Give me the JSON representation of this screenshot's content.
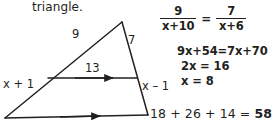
{
  "prompt": {
    "text": "triangle."
  },
  "figure": {
    "name": "triangle-with-parallel-transversal",
    "labels": {
      "upper_left_side": "9",
      "upper_right_side": "7",
      "transversal": "13",
      "lower_left_side": "x + 1",
      "lower_right_side": "x – 1"
    },
    "stroke_color": "#231f20"
  },
  "solution": {
    "proportion": {
      "left": {
        "numerator": "9",
        "denominator": "x+10"
      },
      "equals": "=",
      "right": {
        "numerator": "7",
        "denominator": "x+6"
      }
    },
    "steps": [
      "9x+54=7x+70",
      "2x = 16",
      "x = 8"
    ],
    "final": {
      "expression": "18 + 26 + 14 = ",
      "answer": "58"
    }
  }
}
